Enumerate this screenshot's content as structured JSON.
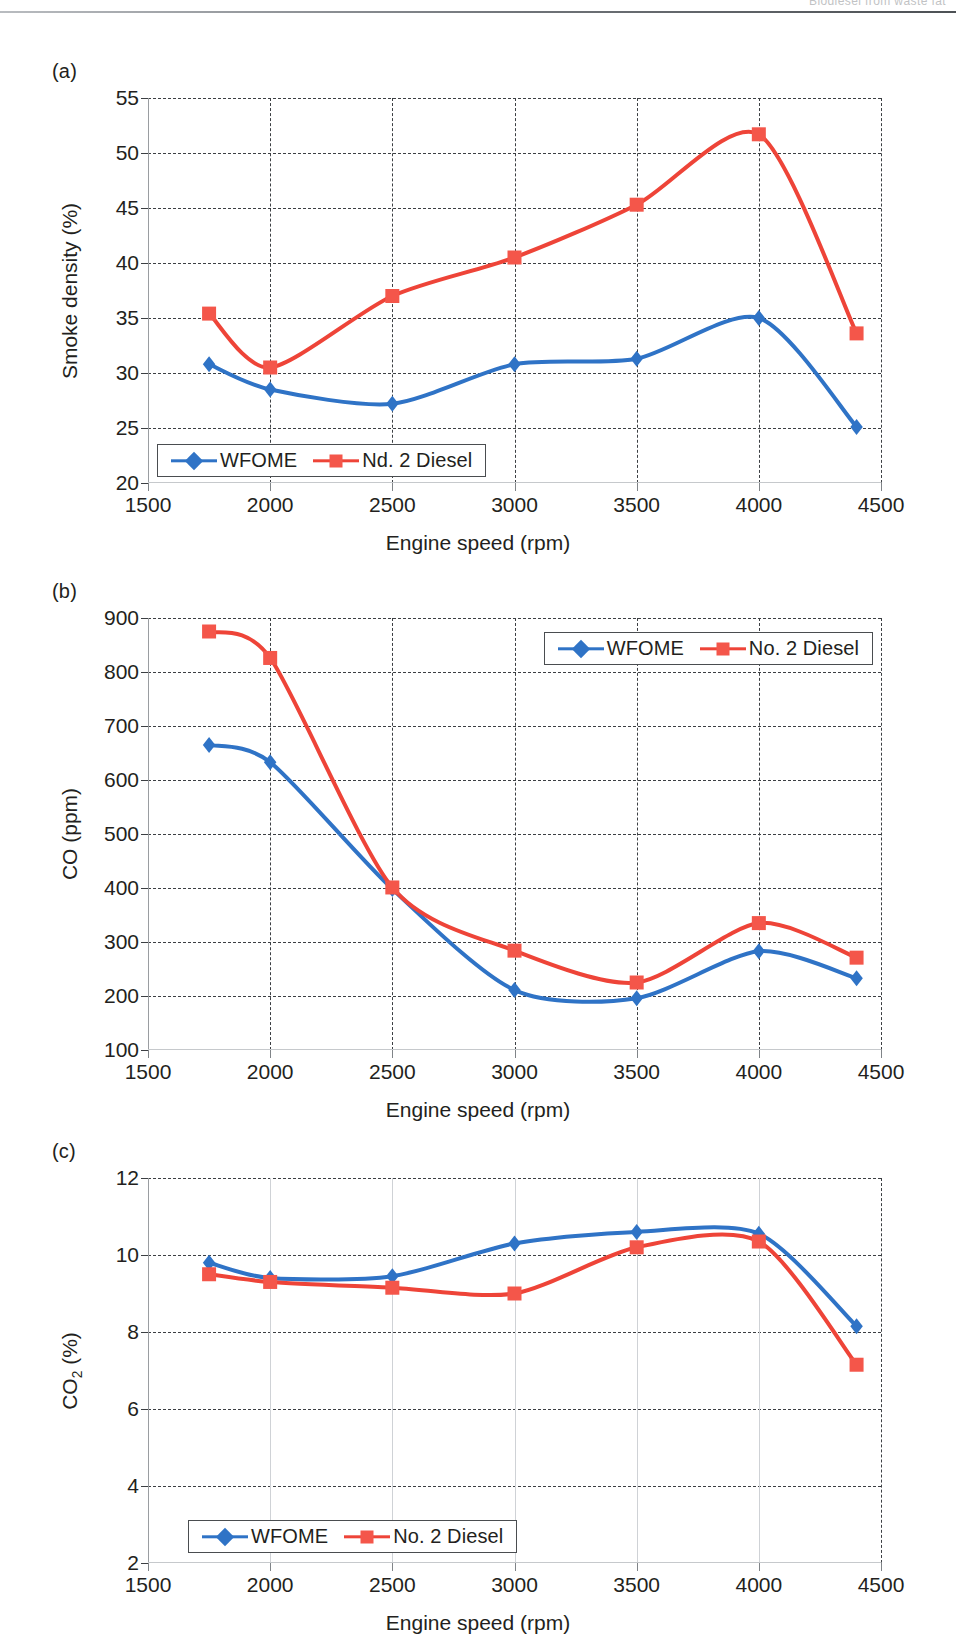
{
  "header": {
    "running_head": "Biodiesel from waste fat"
  },
  "figure": {
    "panels": [
      {
        "label": "(a)"
      },
      {
        "label": "(b)"
      },
      {
        "label": "(c)"
      }
    ]
  },
  "colors": {
    "wfome": "#2f73c6",
    "diesel": "#ee4438",
    "grid": "#3c3f43",
    "axis": "#9a9da1",
    "text": "#231f20"
  },
  "common": {
    "xlabel": "Engine speed (rpm)",
    "xticks": [
      1500,
      2000,
      2500,
      3000,
      3500,
      4000,
      4500
    ],
    "xlim": [
      1500,
      4500
    ]
  },
  "chart_data": [
    {
      "type": "line",
      "panel": "(a)",
      "title": "",
      "xlabel": "Engine speed (rpm)",
      "ylabel": "Smoke density (%)",
      "xlim": [
        1500,
        4500
      ],
      "ylim": [
        20,
        55
      ],
      "xticks": [
        1500,
        2000,
        2500,
        3000,
        3500,
        4000,
        4500
      ],
      "yticks": [
        20,
        25,
        30,
        35,
        40,
        45,
        50,
        55
      ],
      "grid": true,
      "legend_position": "bottom-left",
      "x": [
        1750,
        2000,
        2500,
        3000,
        3500,
        4000,
        4400
      ],
      "series": [
        {
          "name": "WFOME",
          "color": "#2f73c6",
          "marker": "diamond",
          "values": [
            30.8,
            28.5,
            27.2,
            30.8,
            31.3,
            35.0,
            25.1
          ]
        },
        {
          "name": "Nd. 2 Diesel",
          "color": "#ee4438",
          "marker": "square",
          "values": [
            35.4,
            30.5,
            37.0,
            40.5,
            45.3,
            51.7,
            33.6
          ]
        }
      ]
    },
    {
      "type": "line",
      "panel": "(b)",
      "title": "",
      "xlabel": "Engine speed (rpm)",
      "ylabel": "CO (ppm)",
      "xlim": [
        1500,
        4500
      ],
      "ylim": [
        100,
        900
      ],
      "xticks": [
        1500,
        2000,
        2500,
        3000,
        3500,
        4000,
        4500
      ],
      "yticks": [
        100,
        200,
        300,
        400,
        500,
        600,
        700,
        800,
        900
      ],
      "grid": true,
      "legend_position": "top-right",
      "x": [
        1750,
        2000,
        2500,
        3000,
        3500,
        4000,
        4400
      ],
      "series": [
        {
          "name": "WFOME",
          "color": "#2f73c6",
          "marker": "diamond",
          "values": [
            665,
            633,
            398,
            211,
            196,
            283,
            233
          ]
        },
        {
          "name": "No. 2 Diesel",
          "color": "#ee4438",
          "marker": "square",
          "values": [
            875,
            826,
            401,
            284,
            225,
            335,
            271
          ]
        }
      ]
    },
    {
      "type": "line",
      "panel": "(c)",
      "title": "",
      "xlabel": "Engine speed (rpm)",
      "ylabel": "CO2 (%)",
      "ylabel_base": "CO",
      "ylabel_sub": "2",
      "ylabel_suffix": " (%)",
      "xlim": [
        1500,
        4500
      ],
      "ylim": [
        2,
        12
      ],
      "xticks": [
        1500,
        2000,
        2500,
        3000,
        3500,
        4000,
        4500
      ],
      "yticks": [
        2,
        4,
        6,
        8,
        10,
        12
      ],
      "grid": true,
      "legend_position": "bottom-left",
      "x": [
        1750,
        2000,
        2500,
        3000,
        3500,
        4000,
        4400
      ],
      "series": [
        {
          "name": "WFOME",
          "color": "#2f73c6",
          "marker": "diamond",
          "values": [
            9.8,
            9.4,
            9.45,
            10.3,
            10.6,
            10.55,
            8.15
          ]
        },
        {
          "name": "No. 2 Diesel",
          "color": "#ee4438",
          "marker": "square",
          "values": [
            9.5,
            9.3,
            9.15,
            9.0,
            10.2,
            10.35,
            7.15
          ]
        }
      ]
    }
  ]
}
